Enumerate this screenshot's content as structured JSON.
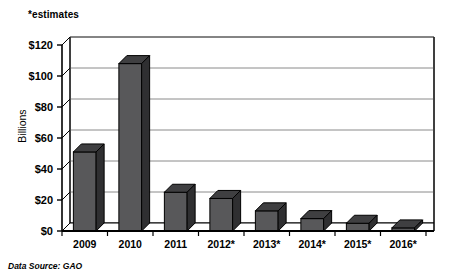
{
  "annotations": {
    "estimates_note": "*estimates",
    "source_note": "Data Source: GAO"
  },
  "colors": {
    "bar_front": "#58585a",
    "bar_top": "#3f3f41",
    "bar_side": "#2f2f31",
    "axis": "#000000",
    "grid": "#8a8a8a",
    "plot_bg": "#ffffff",
    "text": "#000000"
  },
  "chart_data": {
    "type": "bar",
    "title": "",
    "subtitle": "",
    "xlabel": "",
    "ylabel": "Billions",
    "categories": [
      "2009",
      "2010",
      "2011",
      "2012*",
      "2013*",
      "2014*",
      "2015*",
      "2016*"
    ],
    "values": [
      51,
      108,
      25,
      21,
      13,
      8,
      5,
      2
    ],
    "ylim": [
      0,
      120
    ],
    "ytick_step": 20,
    "ytick_labels": [
      "$0",
      "$20",
      "$40",
      "$60",
      "$80",
      "$100",
      "$120"
    ],
    "ytick_values": [
      0,
      20,
      40,
      60,
      80,
      100,
      120
    ],
    "grid": true,
    "grid_axis": "y",
    "legend": false,
    "legend_position": "none",
    "style": "3d-column",
    "annotations": [
      "*estimates",
      "Data Source: GAO"
    ]
  }
}
